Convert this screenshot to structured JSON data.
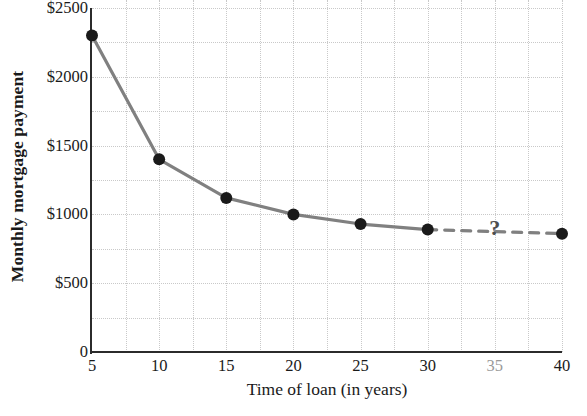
{
  "chart_data": {
    "type": "line",
    "title": "",
    "xlabel": "Time of loan (in years)",
    "ylabel": "Monthly mortgage payment",
    "xlim": [
      5,
      40
    ],
    "ylim": [
      0,
      2500
    ],
    "grid": true,
    "legend": "none",
    "x_tick_labels": [
      "5",
      "10",
      "15",
      "20",
      "25",
      "30",
      "35",
      "40"
    ],
    "x_tick_values": [
      5,
      10,
      15,
      20,
      25,
      30,
      35,
      40
    ],
    "x_tick_dimmed": [
      false,
      false,
      false,
      false,
      false,
      false,
      true,
      false
    ],
    "y_tick_labels": [
      "0",
      "$500",
      "$1000",
      "$1500",
      "$2000",
      "$2500"
    ],
    "y_tick_values": [
      0,
      500,
      1000,
      1500,
      2000,
      2500
    ],
    "y_minor_gridlines": [
      250,
      750,
      1250,
      1750,
      2250
    ],
    "x_minor_gridlines": [
      7.5,
      12.5,
      17.5,
      22.5,
      27.5,
      32.5,
      37.5
    ],
    "series": [
      {
        "name": "Monthly mortgage payment",
        "style": "solid",
        "color": "#808080",
        "x": [
          5,
          10,
          15,
          20,
          25,
          30
        ],
        "values": [
          2300,
          1400,
          1120,
          1000,
          930,
          890
        ]
      },
      {
        "name": "Projected segment",
        "style": "dashed",
        "color": "#808080",
        "x": [
          30,
          40
        ],
        "values": [
          890,
          860
        ]
      }
    ],
    "markers": {
      "shape": "circle",
      "color": "#1a1a1a",
      "radius": 6
    },
    "annotations": [
      {
        "text": "?",
        "x": 35,
        "y": 900,
        "color": "#4d4d4d"
      }
    ]
  }
}
